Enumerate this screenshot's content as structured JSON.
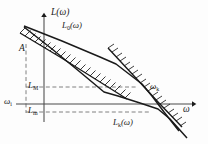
{
  "figure": {
    "background_color": "#fdfdfd",
    "line_color": "#1a1a1a",
    "dashed_color": "#6e6e6e"
  },
  "axes": {
    "y_axis_label": "L(ω)",
    "x_axis_label": "ω",
    "y_axis_name": "vertical-axis",
    "x_axis_name": "horizontal-axis",
    "origin_px": [
      44,
      104
    ],
    "x_axis_end_px": [
      196,
      104
    ],
    "y_axis_top_px": [
      44,
      14
    ]
  },
  "curves": [
    {
      "id": "L0",
      "label": "L₀(ω)",
      "label_base": "L",
      "label_sub": "0",
      "label_tail": "(ω)",
      "style": "solid",
      "description": "open-loop desired log-magnitude characteristic",
      "points": [
        [
          26,
          28
        ],
        [
          100,
          57
        ],
        [
          128,
          73
        ],
        [
          150,
          92
        ],
        [
          178,
          128
        ]
      ]
    },
    {
      "id": "Lk",
      "label": "Lₖ(ω)",
      "label_base": "L",
      "label_sub": "k",
      "label_tail": "(ω)",
      "style": "solid",
      "description": "corrected log-magnitude characteristic",
      "points": [
        [
          26,
          28
        ],
        [
          106,
          94
        ],
        [
          128,
          100
        ],
        [
          160,
          110
        ],
        [
          186,
          136
        ]
      ]
    },
    {
      "id": "upper-bound",
      "label": "",
      "style": "hatched",
      "description": "upper hatched forbidden-region boundary",
      "points": [
        [
          22,
          36
        ],
        [
          100,
          82
        ],
        [
          126,
          98
        ]
      ]
    },
    {
      "id": "lower-bound",
      "label": "",
      "style": "hatched",
      "description": "lower hatched forbidden-region boundary",
      "points": [
        [
          110,
          50
        ],
        [
          150,
          92
        ],
        [
          180,
          122
        ]
      ]
    }
  ],
  "markers": {
    "amplitude_label": "A",
    "omega_i_label": "ωᵢ",
    "omega_i_base": "ω",
    "omega_i_sub": "i",
    "omega_k_label": "ωₖ",
    "omega_k_base": "ω",
    "omega_k_sub": "k",
    "L_M_base": "L",
    "L_M_sub": "M",
    "L_m_base": "L",
    "L_m_sub": "m"
  },
  "guides": [
    {
      "name": "omega-i-vertical-dashed",
      "from_px": [
        26,
        44
      ],
      "to_px": [
        26,
        112
      ]
    },
    {
      "name": "L-M-horizontal-dashed",
      "from_px": [
        26,
        87
      ],
      "to_px": [
        136,
        87
      ]
    },
    {
      "name": "L-m-horizontal-dashed",
      "from_px": [
        26,
        112
      ],
      "to_px": [
        150,
        112
      ]
    }
  ]
}
